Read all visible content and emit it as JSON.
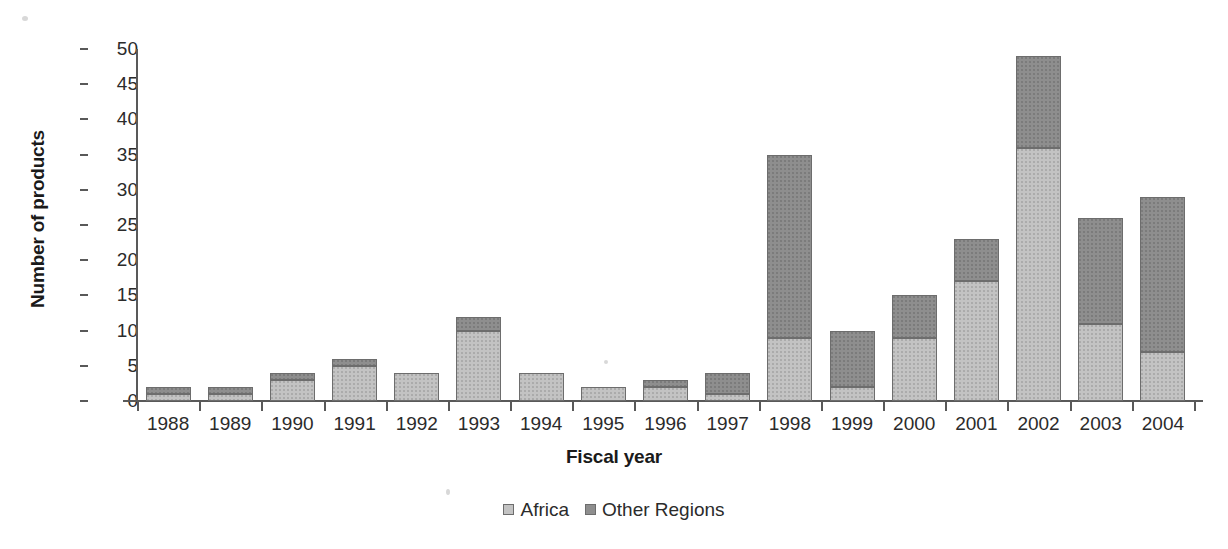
{
  "chart_data": {
    "type": "bar",
    "subtype": "stacked-column",
    "title": "",
    "xlabel": "Fiscal year",
    "ylabel": "Number of products",
    "ylim": [
      0,
      50
    ],
    "yticks": [
      0,
      5,
      10,
      15,
      20,
      25,
      30,
      35,
      40,
      45,
      50
    ],
    "ytick_labels": [
      "0",
      "5",
      "10",
      "15",
      "20",
      "25",
      "30",
      "35",
      "40",
      "45",
      "50"
    ],
    "grid": false,
    "legend_position": "bottom-center",
    "categories": [
      "1988",
      "1989",
      "1990",
      "1991",
      "1992",
      "1993",
      "1994",
      "1995",
      "1996",
      "1997",
      "1998",
      "1999",
      "2000",
      "2001",
      "2002",
      "2003",
      "2004"
    ],
    "series": [
      {
        "name": "Africa",
        "color": "#c3c3c3",
        "values": [
          1,
          1,
          3,
          5,
          4,
          10,
          4,
          2,
          2,
          1,
          9,
          2,
          9,
          17,
          36,
          11,
          7
        ]
      },
      {
        "name": "Other Regions",
        "color": "#8e8e8e",
        "values": [
          1,
          1,
          1,
          1,
          0,
          2,
          0,
          0,
          1,
          3,
          26,
          8,
          6,
          6,
          13,
          15,
          22
        ]
      }
    ],
    "totals": [
      2,
      2,
      4,
      6,
      4,
      12,
      4,
      2,
      3,
      4,
      35,
      10,
      15,
      23,
      49,
      26,
      29
    ]
  },
  "legend": {
    "items": [
      {
        "label": "Africa",
        "swatch": "legend-swatch-africa"
      },
      {
        "label": "Other Regions",
        "swatch": "legend-swatch-other-regions"
      }
    ]
  },
  "axes": {
    "y_title": "Number of products",
    "x_title": "Fiscal year"
  }
}
